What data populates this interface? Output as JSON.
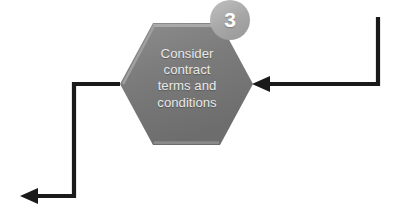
{
  "diagram": {
    "type": "flowchart-step",
    "background_color": "#ffffff",
    "node": {
      "shape": "hexagon",
      "label": "Consider\ncontract\nterms and\nconditions",
      "label_lines": [
        "Consider",
        "contract",
        "terms and",
        "conditions"
      ],
      "fill_color": "#7a7a7a",
      "fill_color_light": "#8d8d8d",
      "fill_color_dark": "#6d6d6d",
      "edge_highlight_color": "#a8a8a8",
      "text_color": "#e8e8e8"
    },
    "badge": {
      "number": "3",
      "fill_color": "#a6a6a6",
      "fill_color_light": "#b8b8b8",
      "text_color": "#ffffff"
    },
    "connectors": [
      {
        "name": "incoming-connector",
        "direction": "right-to-left",
        "color": "#1a1a1a",
        "arrowhead": "left"
      },
      {
        "name": "outgoing-connector",
        "direction": "left-then-down-then-left",
        "color": "#1a1a1a",
        "arrowhead": "left"
      }
    ]
  }
}
